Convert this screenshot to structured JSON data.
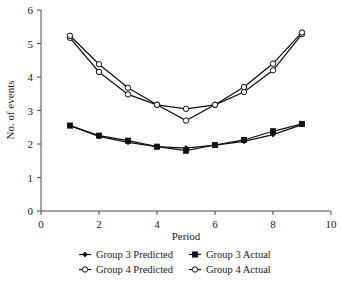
{
  "chart_data": {
    "type": "line",
    "title": "",
    "xlabel": "Period",
    "ylabel": "No. of events",
    "x": [
      1,
      2,
      3,
      4,
      5,
      6,
      7,
      8,
      9
    ],
    "xlim": [
      0,
      10
    ],
    "ylim": [
      0,
      6
    ],
    "xticks": [
      "0",
      "2",
      "4",
      "6",
      "8",
      "10"
    ],
    "xtick_values": [
      0,
      2,
      4,
      6,
      8,
      10
    ],
    "yticks": [
      "0",
      "1",
      "2",
      "3",
      "4",
      "5",
      "6"
    ],
    "ytick_values": [
      0,
      1,
      2,
      3,
      4,
      5,
      6
    ],
    "grid": false,
    "legend_position": "bottom",
    "series": [
      {
        "name": "Group 3 Predicted",
        "marker": "small-filled-diamond",
        "color": "#111111",
        "values": [
          2.55,
          2.23,
          2.05,
          1.92,
          1.88,
          1.97,
          2.08,
          2.28,
          2.58
        ]
      },
      {
        "name": "Group 3 Actual",
        "marker": "filled-square",
        "color": "#111111",
        "values": [
          2.55,
          2.25,
          2.1,
          1.92,
          1.8,
          1.97,
          2.12,
          2.38,
          2.6
        ]
      },
      {
        "name": "Group 4 Predicted",
        "marker": "open-circle",
        "color": "#111111",
        "values": [
          5.17,
          4.15,
          3.48,
          3.17,
          3.05,
          3.17,
          3.55,
          4.2,
          5.28
        ]
      },
      {
        "name": "Group 4 Actual",
        "marker": "open-circle",
        "color": "#111111",
        "values": [
          5.23,
          4.38,
          3.68,
          3.17,
          2.7,
          3.17,
          3.7,
          4.4,
          5.33
        ]
      }
    ]
  },
  "legend": {
    "entries": [
      {
        "label": "Group 3 Predicted",
        "marker": "small-filled-diamond"
      },
      {
        "label": "Group 3 Actual",
        "marker": "filled-square"
      },
      {
        "label": "Group 4 Predicted",
        "marker": "open-circle"
      },
      {
        "label": "Group 4 Actual",
        "marker": "open-circle"
      }
    ]
  }
}
